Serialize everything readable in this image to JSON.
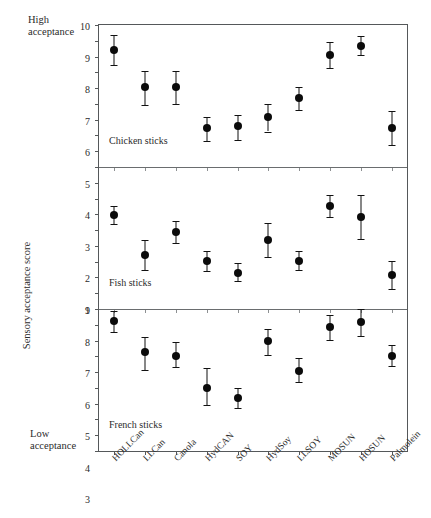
{
  "labels": {
    "high_acceptance": "High\nacceptance",
    "low_acceptance": "Low\nacceptance",
    "y_axis_title": "Sensory acceptance score"
  },
  "chart_data": {
    "type": "scatter",
    "title": "",
    "xlabel": "",
    "ylabel": "Sensory acceptance score",
    "grid": false,
    "legend": "none",
    "categories": [
      "HOLLCan",
      "LLCan",
      "Canola",
      "HydCAN",
      "SOY",
      "HydSoy",
      "LLSOY",
      "MOSUN",
      "HOSUN",
      "Palmolein"
    ],
    "panels": [
      {
        "name": "Chicken sticks",
        "ylim": [
          1,
          10
        ],
        "yticks": [
          10,
          9,
          8,
          7,
          6,
          5,
          4,
          3,
          2,
          1
        ],
        "values": [
          8.4,
          6.05,
          6.05,
          3.45,
          3.6,
          4.15,
          5.4,
          8.1,
          8.7,
          3.5
        ],
        "err_low": [
          7.45,
          4.9,
          5.0,
          2.65,
          2.7,
          3.25,
          4.6,
          7.3,
          8.1,
          2.4
        ],
        "err_high": [
          9.35,
          7.1,
          7.1,
          4.2,
          4.3,
          5.0,
          6.1,
          8.9,
          9.3,
          4.55
        ]
      },
      {
        "name": "Fish sticks",
        "ylim": [
          0,
          9
        ],
        "yticks": [
          9,
          8,
          7,
          6,
          5,
          4,
          3,
          2,
          1,
          0
        ],
        "values": [
          5.95,
          3.4,
          4.9,
          3.05,
          2.3,
          4.4,
          3.05,
          6.5,
          5.85,
          2.15
        ],
        "err_low": [
          5.4,
          2.45,
          4.2,
          2.4,
          1.75,
          3.3,
          2.45,
          5.8,
          4.45,
          1.25
        ],
        "err_high": [
          6.5,
          4.35,
          5.6,
          3.7,
          2.9,
          5.45,
          3.65,
          7.2,
          7.25,
          3.05
        ]
      },
      {
        "name": "French sticks",
        "ylim": [
          0,
          9
        ],
        "yticks": [
          9,
          8,
          7,
          6,
          5,
          4,
          3,
          2,
          1,
          0
        ],
        "values": [
          8.25,
          6.25,
          6.05,
          4.0,
          3.35,
          6.95,
          5.1,
          7.85,
          8.2,
          6.05
        ],
        "err_low": [
          7.55,
          5.15,
          5.3,
          2.9,
          2.75,
          6.1,
          4.35,
          7.05,
          7.3,
          5.4
        ],
        "err_high": [
          8.9,
          7.25,
          6.9,
          5.25,
          4.0,
          7.75,
          5.9,
          8.6,
          9.0,
          6.75
        ]
      }
    ]
  }
}
